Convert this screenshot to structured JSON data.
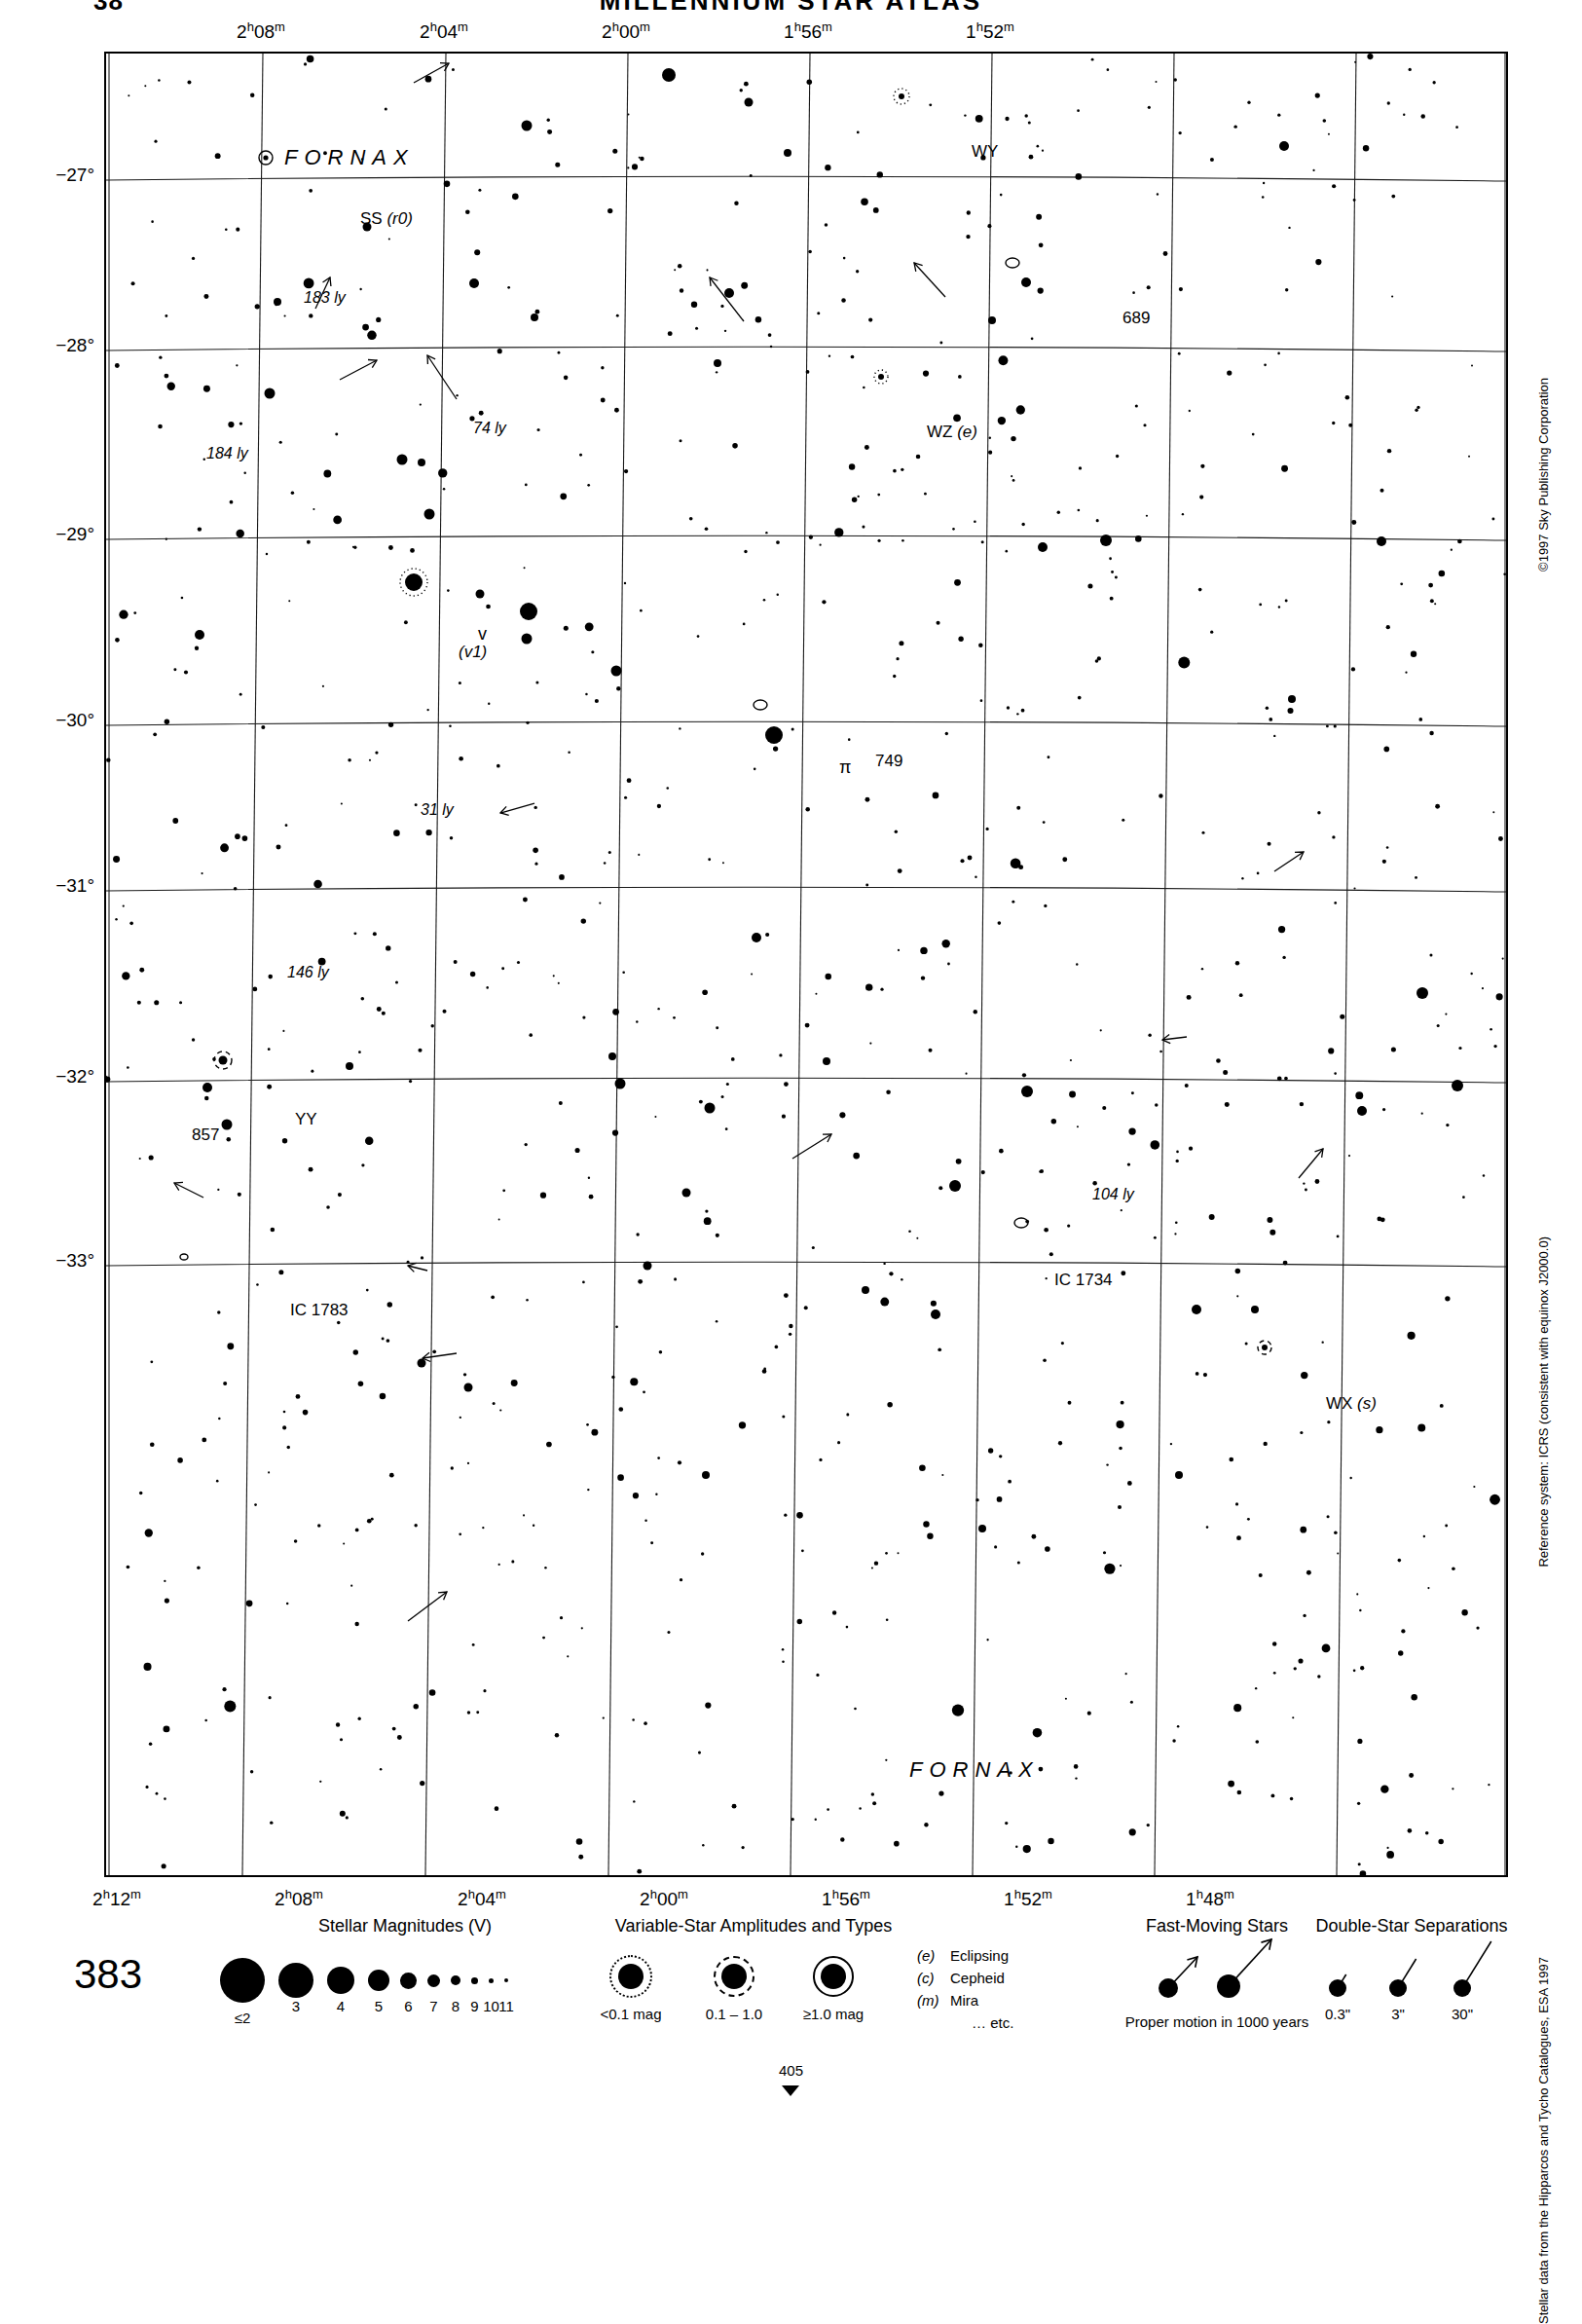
{
  "header": {
    "folio_left": "38",
    "atlas_title": "MILLENNIUM STAR ATLAS"
  },
  "page_number": "383",
  "side_notes": {
    "copyright": "©1997 Sky Publishing Corporation",
    "reference_system": "Reference system: ICRS (consistent with equinox J2000.0)",
    "data_source": "Stellar data from the Hipparcos and Tycho Catalogues, ESA 1997"
  },
  "chart_data": {
    "type": "scatter",
    "xlabel": "Right Ascension",
    "ylabel": "Declination",
    "grid": true,
    "xlim": [
      "2h 13m",
      "1h 47m"
    ],
    "ylim": [
      -33.6,
      -26.4
    ],
    "ra_ticks_top": [
      "2h 08m",
      "2h 04m",
      "2h 00m",
      "1h 56m",
      "1h 52m"
    ],
    "ra_ticks_bottom": [
      "2h 12m",
      "2h 08m",
      "2h 04m",
      "2h 00m",
      "1h 56m",
      "1h 52m",
      "1h 48m"
    ],
    "dec_ticks": [
      "-27°",
      "-28°",
      "-29°",
      "-30°",
      "-31°",
      "-32°",
      "-33°"
    ],
    "constellation_labels": [
      {
        "name": "FORNAX",
        "x": 183,
        "y": 95
      },
      {
        "name": "FORNAX",
        "x": 825,
        "y": 1751
      }
    ],
    "object_labels": [
      {
        "text": "SS (r0)",
        "kind": "variable-star",
        "x": 261,
        "y": 161
      },
      {
        "text": "WY",
        "kind": "variable-star",
        "x": 889,
        "y": 92
      },
      {
        "text": "689",
        "kind": "deep-sky",
        "x": 1044,
        "y": 263
      },
      {
        "text": "WZ (e)",
        "kind": "variable-star",
        "x": 843,
        "y": 380
      },
      {
        "text": "183 ly",
        "kind": "distance",
        "x": 203,
        "y": 243
      },
      {
        "text": "184 ly",
        "kind": "distance",
        "x": 103,
        "y": 403
      },
      {
        "text": "74 ly",
        "kind": "distance",
        "x": 377,
        "y": 377
      },
      {
        "text": "v",
        "kind": "bayer",
        "x": 382,
        "y": 587
      },
      {
        "text": "(v1)",
        "kind": "variable-star",
        "x": 362,
        "y": 606
      },
      {
        "text": "31 ly",
        "kind": "distance",
        "x": 323,
        "y": 769
      },
      {
        "text": "749",
        "kind": "deep-sky",
        "x": 790,
        "y": 718
      },
      {
        "text": "π",
        "kind": "bayer",
        "x": 753,
        "y": 724
      },
      {
        "text": "146 ly",
        "kind": "distance",
        "x": 186,
        "y": 936
      },
      {
        "text": "WX (s)",
        "kind": "variable-star",
        "x": 1253,
        "y": 1378
      },
      {
        "text": "YY",
        "kind": "variable-star",
        "x": 194,
        "y": 1086
      },
      {
        "text": "857",
        "kind": "deep-sky",
        "x": 88,
        "y": 1102
      },
      {
        "text": "104 ly",
        "kind": "distance",
        "x": 1013,
        "y": 1164
      },
      {
        "text": "IC 1734",
        "kind": "deep-sky",
        "x": 974,
        "y": 1251
      },
      {
        "text": "IC 1783",
        "kind": "deep-sky",
        "x": 189,
        "y": 1282
      }
    ]
  },
  "legend": {
    "magnitudes": {
      "title": "Stellar Magnitudes (V)",
      "labels": [
        "≤2",
        "3",
        "4",
        "5",
        "6",
        "7",
        "8",
        "9",
        "10",
        "11"
      ],
      "diameters": [
        46,
        36,
        28,
        22,
        17,
        13,
        10,
        7,
        5,
        4
      ]
    },
    "variables": {
      "title": "Variable-Star Amplitudes and Types",
      "amplitudes": [
        "<0.1 mag",
        "0.1 – 1.0",
        "≥1.0 mag"
      ],
      "types": [
        {
          "code": "(e)",
          "name": "Eclipsing"
        },
        {
          "code": "(c)",
          "name": "Cepheid"
        },
        {
          "code": "(m)",
          "name": "Mira"
        },
        {
          "code": "",
          "name": "… etc."
        }
      ]
    },
    "fast_moving": {
      "title": "Fast-Moving Stars",
      "caption": "Proper motion in 1000 years"
    },
    "doubles": {
      "title": "Double-Star Separations",
      "labels": [
        "0.3\"",
        "3\"",
        "30\""
      ]
    },
    "sequence_marker": "405"
  }
}
